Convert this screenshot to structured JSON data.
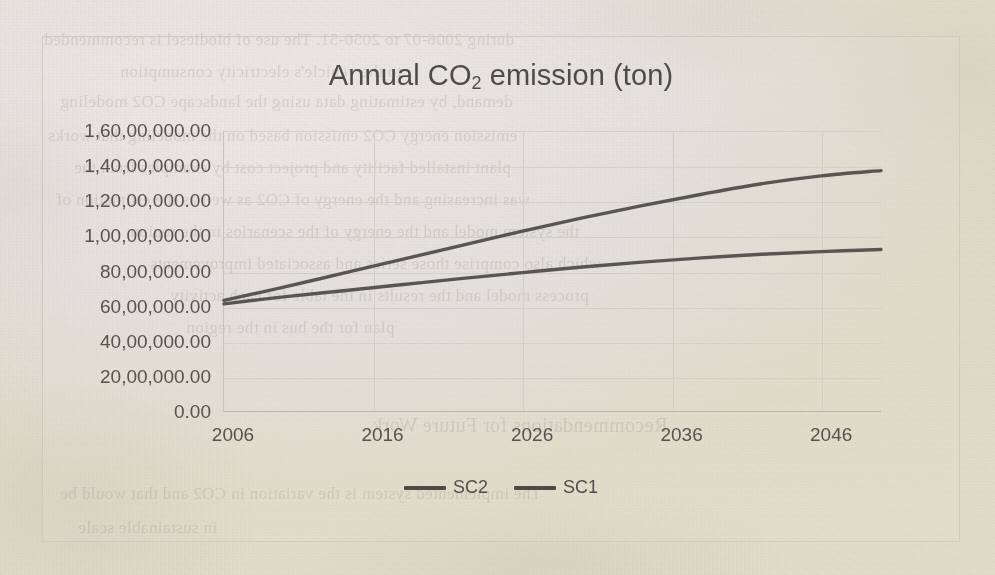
{
  "document": {
    "kind": "scanned-page",
    "paper_color": "#f2f0ed",
    "ink_color": "#4e4c49"
  },
  "chart": {
    "title_main": "Annual CO",
    "title_sub": "2",
    "title_tail": " emission (ton)",
    "title_plain": "Annual CO2 emission (ton)",
    "line_color": "#4d4b48",
    "gridline_color": "#d2cfc9",
    "frame_color": "#cdcac4"
  },
  "legend": {
    "position": "bottom-center",
    "items": [
      {
        "label": "SC2",
        "color": "#4d4b48"
      },
      {
        "label": "SC1",
        "color": "#4d4b48"
      }
    ]
  },
  "axes": {
    "y_ticklabels": [
      "1,60,00,000.00",
      "1,40,00,000.00",
      "1,20,00,000.00",
      "1,00,00,000.00",
      "80,00,000.00",
      "60,00,000.00",
      "40,00,000.00",
      "20,00,000.00",
      "0.00"
    ],
    "x_ticklabels": [
      "2006",
      "2016",
      "2026",
      "2036",
      "2046"
    ]
  },
  "bleed_through_lines": [
    {
      "text": "during 2006-07 to 2050-51. The use of biodiesel is recommended",
      "top": 30,
      "left": 44,
      "size": 17
    },
    {
      "text": "to the vehicle's electricity consumption",
      "top": 62,
      "left": 120,
      "size": 17
    },
    {
      "text": "demand, by estimating data using the landscape CO2 modeling",
      "top": 92,
      "left": 60,
      "size": 17
    },
    {
      "text": "emission energy CO2 emission based on the modeling that works",
      "top": 126,
      "left": 48,
      "size": 17
    },
    {
      "text": "plant installed facility and project cost by examples from the",
      "top": 158,
      "left": 74,
      "size": 17
    },
    {
      "text": "was increasing and the energy of CO2 as well as the estimation of",
      "top": 190,
      "left": 56,
      "size": 17
    },
    {
      "text": "the system model and the energy of the scenarios in the region",
      "top": 222,
      "left": 130,
      "size": 17
    },
    {
      "text": "which also comprise those series and associated improvements",
      "top": 254,
      "left": 150,
      "size": 17
    },
    {
      "text": "process model and the results in the table for each activity",
      "top": 286,
      "left": 170,
      "size": 17
    },
    {
      "text": "plan for the bus in the region",
      "top": 318,
      "left": 186,
      "size": 17
    },
    {
      "text": "Recommendations for Future Work",
      "top": 414,
      "left": 372,
      "size": 20
    },
    {
      "text": "The implemented system is the variation in CO2 and that would be",
      "top": 484,
      "left": 60,
      "size": 17
    },
    {
      "text": "in sustainable scale",
      "top": 518,
      "left": 78,
      "size": 17
    }
  ],
  "chart_data": {
    "type": "line",
    "title": "Annual CO2 emission (ton)",
    "xlabel": "",
    "ylabel": "",
    "ylim": [
      0,
      16000000
    ],
    "xlim": [
      2006,
      2050
    ],
    "ytick_step": 2000000,
    "grid": true,
    "legend_position": "bottom-center",
    "units": "ton",
    "number_format": "indian-lakh-crore",
    "x": [
      2006,
      2010,
      2014,
      2018,
      2022,
      2026,
      2030,
      2034,
      2038,
      2042,
      2046,
      2050
    ],
    "series": [
      {
        "name": "SC2",
        "color": "#4d4b48",
        "values": [
          6400000,
          7150000,
          7950000,
          8750000,
          9550000,
          10350000,
          11100000,
          11800000,
          12450000,
          13050000,
          13500000,
          13800000
        ]
      },
      {
        "name": "SC1",
        "color": "#4d4b48",
        "values": [
          6200000,
          6600000,
          6950000,
          7300000,
          7650000,
          7980000,
          8300000,
          8580000,
          8820000,
          9030000,
          9180000,
          9300000
        ]
      }
    ]
  }
}
